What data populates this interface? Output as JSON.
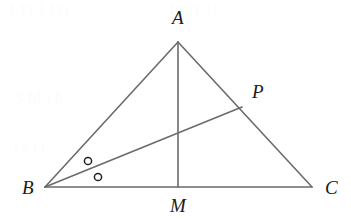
{
  "figure": {
    "width": 351,
    "height": 220,
    "background_color": "#ffffff",
    "stroke_color": "#6b6b6b",
    "label_color": "#1a1a1a",
    "marker_color": "#222222",
    "stroke_width": 1.6,
    "label_font_size": 19
  },
  "points": {
    "A": {
      "label": "A",
      "x": 178,
      "y": 42,
      "label_x": 172,
      "label_y": 24
    },
    "B": {
      "label": "B",
      "x": 45,
      "y": 187,
      "label_x": 22,
      "label_y": 194
    },
    "C": {
      "label": "C",
      "x": 312,
      "y": 187,
      "label_x": 325,
      "label_y": 194
    },
    "M": {
      "label": "M",
      "x": 178,
      "y": 187,
      "label_x": 170,
      "label_y": 212
    },
    "P": {
      "label": "P",
      "x": 242,
      "y": 107,
      "label_x": 252,
      "label_y": 98
    }
  },
  "segments": [
    {
      "name": "side-AB",
      "from": "A",
      "to": "B",
      "x1": 178,
      "y1": 42,
      "x2": 45,
      "y2": 187
    },
    {
      "name": "side-AC",
      "from": "A",
      "to": "C",
      "x1": 178,
      "y1": 42,
      "x2": 312,
      "y2": 187
    },
    {
      "name": "side-BC",
      "from": "B",
      "to": "C",
      "x1": 45,
      "y1": 187,
      "x2": 312,
      "y2": 187
    },
    {
      "name": "median-AM",
      "from": "A",
      "to": "M",
      "x1": 178,
      "y1": 42,
      "x2": 178,
      "y2": 187
    },
    {
      "name": "cevian-BP",
      "from": "B",
      "to": "P",
      "x1": 45,
      "y1": 187,
      "x2": 242,
      "y2": 107
    }
  ],
  "angle_markers": [
    {
      "name": "angle-marker-abp",
      "cx": 88,
      "cy": 161,
      "r": 3.6
    },
    {
      "name": "angle-marker-pbm",
      "cx": 98,
      "cy": 177,
      "r": 3.6
    }
  ],
  "scan_artifacts": [
    {
      "text": "1 11 1 111",
      "x": 8,
      "y": 2,
      "size": 15
    },
    {
      "text": "11 11  11",
      "x": 168,
      "y": 2,
      "size": 15
    },
    {
      "text": "S  hf  j  h",
      "x": 14,
      "y": 88,
      "size": 17
    },
    {
      "text": "l  h  l  j",
      "x": 14,
      "y": 140,
      "size": 15
    }
  ]
}
